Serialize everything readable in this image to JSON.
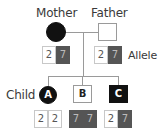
{
  "labels": {
    "mother": "Mother",
    "father": "Father",
    "allele": "Allele",
    "child": "Child"
  },
  "parents": {
    "mother": {
      "shape": "circle",
      "affected": true,
      "alleles": [
        "2",
        "7"
      ]
    },
    "father": {
      "shape": "square",
      "affected": false,
      "alleles": [
        "2",
        "7"
      ]
    }
  },
  "children": [
    {
      "id": "A",
      "shape": "circle",
      "affected": true,
      "alleles": [
        "2",
        "2"
      ]
    },
    {
      "id": "B",
      "shape": "square",
      "affected": false,
      "alleles": [
        "7",
        "7"
      ]
    },
    {
      "id": "C",
      "shape": "square",
      "affected": true,
      "alleles": [
        "2",
        "7"
      ]
    }
  ],
  "colors": {
    "affected_fill": "#111111",
    "allele_2_fill": "#ffffff",
    "allele_7_fill": "#555555",
    "line": "#9a9a9a"
  }
}
